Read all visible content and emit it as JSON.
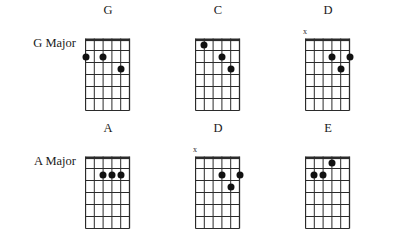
{
  "chart_data": {
    "type": "diagram",
    "subtitle": "",
    "diagram_kind": "guitar-chord-grid",
    "strings": 6,
    "frets": 6,
    "dot_symbol": "●",
    "mute_symbol": "x",
    "colors": {
      "grid": "#2b2b2b",
      "nut": "#2b2b2b",
      "dot": "#111111",
      "text": "#1a1a1a",
      "background": "#ffffff"
    },
    "rows": [
      {
        "label": "G Major",
        "chords": [
          {
            "name": "G",
            "muted_strings": [],
            "dots": [
              {
                "string": 1,
                "fret": 2
              },
              {
                "string": 3,
                "fret": 2
              },
              {
                "string": 5,
                "fret": 3
              }
            ]
          },
          {
            "name": "C",
            "muted_strings": [],
            "dots": [
              {
                "string": 2,
                "fret": 1
              },
              {
                "string": 4,
                "fret": 2
              },
              {
                "string": 5,
                "fret": 3
              }
            ]
          },
          {
            "name": "D",
            "muted_strings": [
              1
            ],
            "dots": [
              {
                "string": 4,
                "fret": 2
              },
              {
                "string": 5,
                "fret": 3
              },
              {
                "string": 6,
                "fret": 2
              }
            ]
          }
        ]
      },
      {
        "label": "A Major",
        "chords": [
          {
            "name": "A",
            "muted_strings": [],
            "dots": [
              {
                "string": 3,
                "fret": 2
              },
              {
                "string": 4,
                "fret": 2
              },
              {
                "string": 5,
                "fret": 2
              }
            ]
          },
          {
            "name": "D",
            "muted_strings": [
              1
            ],
            "dots": [
              {
                "string": 4,
                "fret": 2
              },
              {
                "string": 5,
                "fret": 3
              },
              {
                "string": 6,
                "fret": 2
              }
            ]
          },
          {
            "name": "E",
            "muted_strings": [],
            "dots": [
              {
                "string": 2,
                "fret": 2
              },
              {
                "string": 3,
                "fret": 2
              },
              {
                "string": 4,
                "fret": 1
              }
            ]
          }
        ]
      }
    ]
  }
}
